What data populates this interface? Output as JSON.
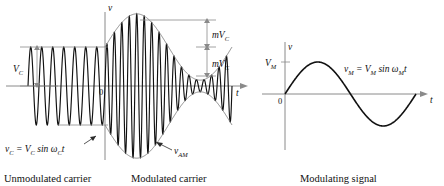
{
  "figure": {
    "kind": "amplitude-modulation-waveform-figure",
    "panels": [
      {
        "id": "unmodulated-carrier",
        "caption": "Unmodulated carrier",
        "equation": {
          "lhs": "v",
          "lhs_sub": "C",
          "rhs": "= V",
          "rhs_sub": "C",
          "tail": " sin ω",
          "tail_sub": "C",
          "tail_end": "t"
        },
        "amplitude_label": {
          "symbol": "V",
          "sub": "C"
        }
      },
      {
        "id": "modulated-carrier",
        "caption": "Modulated carrier",
        "signal_label": {
          "symbol": "v",
          "sub": "AM"
        },
        "axis_v": "v",
        "axis_t": "t",
        "origin": "0",
        "dimensions": [
          {
            "symbol": "mV",
            "sub": "C"
          },
          {
            "symbol": "mV",
            "sub": "C"
          }
        ]
      },
      {
        "id": "modulating-signal",
        "caption": "Modulating signal",
        "axis_v": "v",
        "axis_t": "t",
        "origin": "0",
        "amplitude_label": {
          "symbol": "V",
          "sub": "M"
        },
        "equation": {
          "lhs": "v",
          "lhs_sub": "M",
          "rhs": "= V",
          "rhs_sub": "M",
          "tail": " sin ω",
          "tail_sub": "M",
          "tail_end": "t"
        }
      }
    ]
  },
  "colors": {
    "wave": "#111111",
    "axis": "#8a8a8a",
    "envelope": "#7d7d7d",
    "background": "#ffffff"
  },
  "chart_data": {
    "type": "line",
    "title": "",
    "xlabel": "t",
    "ylabel": "v",
    "grid": false,
    "legend": "none",
    "charts": [
      {
        "id": "carrier-and-am",
        "panel": "Unmodulated carrier / Modulated carrier",
        "x_axis": {
          "label": "t",
          "range": [
            0,
            1
          ]
        },
        "y_axis": {
          "label": "v",
          "range": [
            -1.9,
            1.9
          ]
        },
        "series": [
          {
            "name": "v_C = V_C sin ω_C t",
            "region": "unmodulated",
            "type": "sinusoid",
            "amplitude": 1.0,
            "cycles": 7,
            "x_start": 0.0,
            "x_end": 0.33
          },
          {
            "name": "v_AM",
            "region": "modulated",
            "type": "am-modulated-sinusoid",
            "carrier_amplitude": 1.0,
            "modulation_index": 0.85,
            "carrier_cycles": 17,
            "modulating_cycles": 1,
            "x_start": 0.33,
            "x_end": 1.0
          },
          {
            "name": "upper envelope",
            "type": "envelope",
            "values_desc": "V_C(1 + m sin ω_M t)"
          },
          {
            "name": "lower envelope",
            "type": "envelope",
            "values_desc": "-V_C(1 + m sin ω_M t)"
          }
        ],
        "annotations": [
          {
            "text": "V_C",
            "kind": "dimension",
            "meaning": "carrier peak amplitude"
          },
          {
            "text": "mV_C",
            "kind": "dimension",
            "meaning": "upper modulation excursion"
          },
          {
            "text": "mV_C",
            "kind": "dimension",
            "meaning": "lower modulation excursion"
          },
          {
            "text": "v_C = V_C sin ω_C t",
            "kind": "equation"
          },
          {
            "text": "v_AM",
            "kind": "callout"
          }
        ]
      },
      {
        "id": "modulating-signal",
        "panel": "Modulating signal",
        "x_axis": {
          "label": "t",
          "range": [
            0,
            1
          ]
        },
        "y_axis": {
          "label": "v",
          "range": [
            -1.15,
            1.15
          ],
          "ticks": [
            "V_M"
          ]
        },
        "series": [
          {
            "name": "v_M = V_M sin ω_M t",
            "type": "sinusoid",
            "amplitude": 1.0,
            "cycles": 1,
            "x_start": 0.0,
            "x_end": 1.0
          }
        ],
        "annotations": [
          {
            "text": "V_M",
            "kind": "y-tick"
          },
          {
            "text": "0",
            "kind": "origin"
          },
          {
            "text": "v_M = V_M sin ω_M t",
            "kind": "equation"
          }
        ]
      }
    ]
  }
}
